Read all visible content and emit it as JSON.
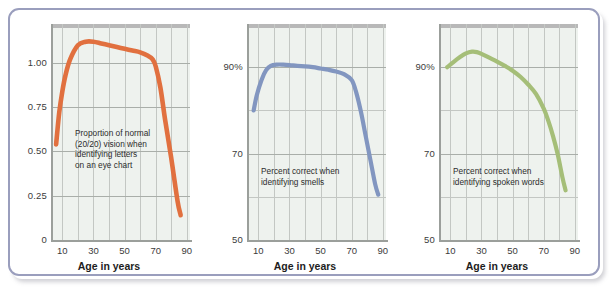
{
  "figure": {
    "background_color": "#ffffff",
    "frame_color": "#9a9ebd",
    "panel_bg_color": "#eef2ee"
  },
  "chart_data": [
    {
      "type": "line",
      "title": "",
      "xlabel": "Age in years",
      "ylabel": "",
      "annotation": "Proportion of normal\n(20/20) vision when\nidentifying letters\non an eye chart",
      "series_color": "#e1703f",
      "xlim": [
        4,
        92
      ],
      "ylim": [
        0,
        1.22
      ],
      "xticks": [
        10,
        30,
        50,
        70,
        90
      ],
      "xtick_labels": [
        "10",
        "30",
        "50",
        "70",
        "90"
      ],
      "yticks": [
        0,
        0.25,
        0.5,
        0.75,
        1.0
      ],
      "ytick_labels": [
        "0",
        "0.25",
        "0.50",
        "0.75",
        "1.00"
      ],
      "grid": true,
      "x": [
        6,
        8,
        10,
        12,
        15,
        20,
        25,
        30,
        35,
        40,
        45,
        50,
        55,
        60,
        65,
        68,
        70,
        73,
        76,
        80,
        84,
        86
      ],
      "y": [
        0.54,
        0.72,
        0.84,
        0.93,
        1.02,
        1.1,
        1.12,
        1.12,
        1.11,
        1.1,
        1.09,
        1.08,
        1.07,
        1.06,
        1.04,
        1.02,
        0.98,
        0.86,
        0.68,
        0.46,
        0.22,
        0.14
      ]
    },
    {
      "type": "line",
      "title": "",
      "xlabel": "Age in years",
      "ylabel": "",
      "annotation": "Percent correct when\nidentifying smells",
      "series_color": "#8296c0",
      "xlim": [
        4,
        92
      ],
      "ylim": [
        50,
        100
      ],
      "xticks": [
        10,
        30,
        50,
        70,
        90
      ],
      "xtick_labels": [
        "10",
        "30",
        "50",
        "70",
        "90"
      ],
      "yticks": [
        50,
        70,
        90
      ],
      "ytick_labels": [
        "50",
        "70",
        "90%"
      ],
      "grid": true,
      "x": [
        7,
        9,
        12,
        15,
        18,
        22,
        26,
        30,
        35,
        40,
        45,
        50,
        55,
        60,
        65,
        70,
        73,
        76,
        79,
        82,
        85,
        87
      ],
      "y": [
        80.0,
        83.5,
        87.0,
        89.3,
        90.3,
        90.6,
        90.6,
        90.5,
        90.3,
        90.2,
        90.0,
        89.7,
        89.4,
        89.0,
        88.4,
        87.0,
        84.0,
        79.5,
        74.0,
        68.5,
        63.0,
        60.5
      ]
    },
    {
      "type": "line",
      "title": "",
      "xlabel": "Age in years",
      "ylabel": "",
      "annotation": "Percent correct when\nidentifying spoken words",
      "series_color": "#a5be78",
      "xlim": [
        4,
        92
      ],
      "ylim": [
        50,
        100
      ],
      "xticks": [
        10,
        30,
        50,
        70,
        90
      ],
      "xtick_labels": [
        "10",
        "30",
        "50",
        "70",
        "90"
      ],
      "yticks": [
        50,
        70,
        90
      ],
      "ytick_labels": [
        "50",
        "70",
        "90%"
      ],
      "grid": true,
      "x": [
        8,
        12,
        16,
        20,
        24,
        27,
        30,
        35,
        40,
        45,
        50,
        55,
        60,
        65,
        70,
        73,
        76,
        79,
        82,
        84
      ],
      "y": [
        90.0,
        91.2,
        92.3,
        93.2,
        93.6,
        93.5,
        93.1,
        92.2,
        91.3,
        90.3,
        89.2,
        87.8,
        86.0,
        83.8,
        80.4,
        77.5,
        74.0,
        69.8,
        64.5,
        61.5
      ]
    }
  ]
}
